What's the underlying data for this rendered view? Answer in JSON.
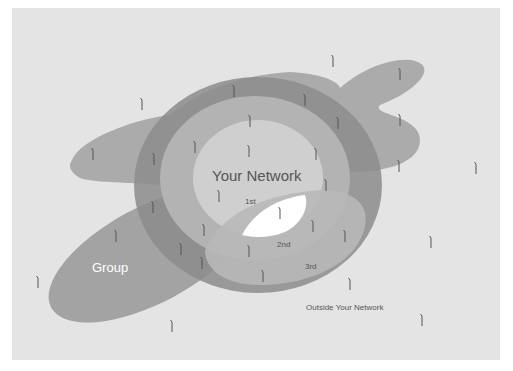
{
  "diagram": {
    "labels": {
      "your_network": "Your Network",
      "first": "1st",
      "second": "2nd",
      "third": "3rd",
      "group": "Group",
      "outside": "Outside Your Network"
    },
    "colors": {
      "background": "#e4e4e4",
      "group_blob": "#a8a8a8",
      "third_ring": "#8e8e8e",
      "second_ring": "#b4b4b4",
      "first_circle": "#cfcfcf",
      "highlight": "#ffffff",
      "text_dark": "#555555",
      "text_light": "#ffffff"
    },
    "person_icon": "person-icon"
  }
}
